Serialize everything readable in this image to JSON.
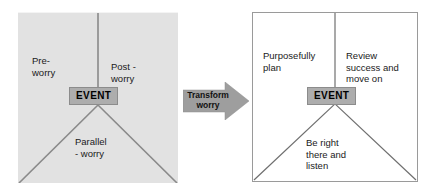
{
  "diagram": {
    "colors": {
      "left_panel_fill": "#e2e2e2",
      "right_panel_fill": "#ffffff",
      "event_chip_fill": "#adadad",
      "arrow_fill": "#9e9e9e",
      "line_stroke": "#8a8a8a",
      "right_line_stroke": "#6e6e6e",
      "text": "#1a1a1a"
    },
    "left_panel": {
      "name": "worry-model",
      "event_label": "EVENT",
      "regions": [
        {
          "key": "pre",
          "label": "Pre-\nworry"
        },
        {
          "key": "post",
          "label": "Post -\nworry"
        },
        {
          "key": "parallel",
          "label": "Parallel\n- worry"
        }
      ]
    },
    "arrow": {
      "label": "Transform\nworry",
      "direction": "right"
    },
    "right_panel": {
      "name": "transformed-model",
      "event_label": "EVENT",
      "regions": [
        {
          "key": "before",
          "label": "Purposefully\nplan"
        },
        {
          "key": "after",
          "label": "Review\nsuccess and\nmove on"
        },
        {
          "key": "during",
          "label": "Be right\nthere and\nlisten"
        }
      ]
    }
  }
}
